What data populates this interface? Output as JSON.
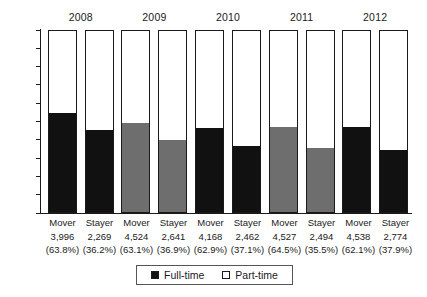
{
  "chart_data": {
    "type": "bar",
    "subtype": "stacked-100-percent",
    "title": "",
    "xlabel": "",
    "ylabel": "",
    "ylim": [
      0,
      100
    ],
    "y_tick_labels": [
      "100%",
      "90%",
      "80%",
      "70%",
      "60%",
      "50%",
      "40%",
      "30%",
      "20%",
      "10%",
      "0%"
    ],
    "y_tick_values": [
      100,
      90,
      80,
      70,
      60,
      50,
      40,
      30,
      20,
      10,
      0
    ],
    "grid": false,
    "legend_position": "bottom-center",
    "group_labels": [
      "2008",
      "2009",
      "2010",
      "2011",
      "2012"
    ],
    "categories": [
      "Mover",
      "Stayer",
      "Mover",
      "Stayer",
      "Mover",
      "Stayer",
      "Mover",
      "Stayer",
      "Mover",
      "Stayer"
    ],
    "series": [
      {
        "name": "Full-time",
        "color": "#111111",
        "values": [
          54.6,
          45.2,
          49.2,
          39.7,
          46.4,
          36.4,
          46.9,
          35.6,
          47.0,
          34.4
        ]
      },
      {
        "name": "Part-time",
        "color": "#ffffff",
        "values": [
          45.4,
          54.8,
          50.8,
          60.3,
          53.6,
          63.6,
          53.1,
          64.4,
          53.0,
          65.6
        ]
      }
    ],
    "bars": [
      {
        "year": "2008",
        "category": "Mover",
        "count": "3,996",
        "share": "(63.8%)",
        "full_time_pct": 54.6,
        "fill_color": "#111111"
      },
      {
        "year": "2008",
        "category": "Stayer",
        "count": "2,269",
        "share": "(36.2%)",
        "full_time_pct": 45.2,
        "fill_color": "#111111"
      },
      {
        "year": "2009",
        "category": "Mover",
        "count": "4,524",
        "share": "(63.1%)",
        "full_time_pct": 49.2,
        "fill_color": "#6e6e6e"
      },
      {
        "year": "2009",
        "category": "Stayer",
        "count": "2,641",
        "share": "(36.9%)",
        "full_time_pct": 39.7,
        "fill_color": "#6e6e6e"
      },
      {
        "year": "2010",
        "category": "Mover",
        "count": "4,168",
        "share": "(62.9%)",
        "full_time_pct": 46.4,
        "fill_color": "#111111"
      },
      {
        "year": "2010",
        "category": "Stayer",
        "count": "2,462",
        "share": "(37.1%)",
        "full_time_pct": 36.4,
        "fill_color": "#111111"
      },
      {
        "year": "2011",
        "category": "Mover",
        "count": "4,527",
        "share": "(64.5%)",
        "full_time_pct": 46.9,
        "fill_color": "#6e6e6e"
      },
      {
        "year": "2011",
        "category": "Stayer",
        "count": "2,494",
        "share": "(35.5%)",
        "full_time_pct": 35.6,
        "fill_color": "#6e6e6e"
      },
      {
        "year": "2012",
        "category": "Mover",
        "count": "4,538",
        "share": "(62.1%)",
        "full_time_pct": 47.0,
        "fill_color": "#111111"
      },
      {
        "year": "2012",
        "category": "Stayer",
        "count": "2,774",
        "share": "(37.9%)",
        "full_time_pct": 34.4,
        "fill_color": "#111111"
      }
    ],
    "legend": [
      {
        "label": "Full-time",
        "swatch_color": "#111111"
      },
      {
        "label": "Part-time",
        "swatch_color": "#ffffff"
      }
    ]
  }
}
